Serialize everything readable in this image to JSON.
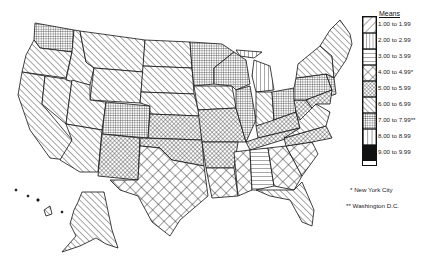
{
  "legend": {
    "title": "Means",
    "items": [
      {
        "label": "1.00 to 1.99",
        "pattern": "diag-back-wide"
      },
      {
        "label": "2.00 to 2.99",
        "pattern": "vertical"
      },
      {
        "label": "3.00 to 3.99",
        "pattern": "horizontal"
      },
      {
        "label": "4.00 to 4.99*",
        "pattern": "crosshatch-diamond-wide"
      },
      {
        "label": "5.00 to 5.99",
        "pattern": "crosshatch-diamond-fine"
      },
      {
        "label": "6.00 to 6.99",
        "pattern": "diag-forward"
      },
      {
        "label": "7.00 to 7.99**",
        "pattern": "grid-fine"
      },
      {
        "label": "8.00 to 8.99",
        "pattern": "vertical-wide"
      },
      {
        "label": "9.00 to 9.99",
        "pattern": "solid-black"
      }
    ],
    "notes": [
      {
        "label": "* New York City"
      },
      {
        "label": "** Washington D.C."
      }
    ]
  },
  "colors": {
    "ink": "#111111",
    "background": "#ffffff"
  },
  "regions": {
    "west_states": "6.00 to 6.99",
    "washington": "7.00 to 7.99",
    "colorado": "7.00 to 7.99",
    "minnesota_wisconsin_illinois": "7.00 to 7.99",
    "michigan": "2.00 to 2.99",
    "indiana": "6.00 to 6.99",
    "ohio_pennsylvania": "7.00 to 7.99",
    "new_england": "6.00 to 6.99",
    "kansas_missouri": "5.00 to 5.99",
    "oklahoma_arkansas": "5.00 to 5.99",
    "texas_louisiana_mississippi": "4.00 to 4.99",
    "alabama": "3.00 to 3.99",
    "georgia_carolinas": "4.00 to 4.99",
    "kentucky_tennessee_virginia": "5.00 to 5.99",
    "florida": "6.00 to 6.99",
    "alaska": "6.00 to 6.99"
  }
}
